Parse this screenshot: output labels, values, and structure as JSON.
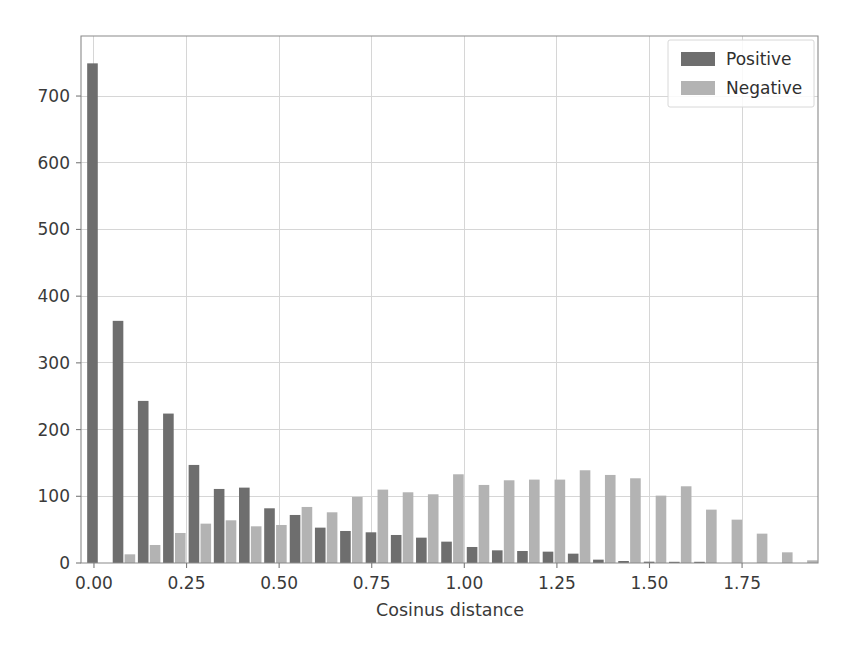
{
  "chart_data": {
    "type": "bar",
    "title": "",
    "subtitle": "",
    "xlabel": "Cosinus distance",
    "ylabel": "",
    "xlim": [
      -0.035,
      1.955
    ],
    "ylim": [
      0,
      790
    ],
    "grid": true,
    "legend_position": "upper right",
    "xticks": [
      0.0,
      0.25,
      0.5,
      0.75,
      1.0,
      1.25,
      1.5,
      1.75
    ],
    "xticklabels": [
      "0.00",
      "0.25",
      "0.50",
      "0.75",
      "1.00",
      "1.25",
      "1.50",
      "1.75"
    ],
    "yticks": [
      0,
      100,
      200,
      300,
      400,
      500,
      600,
      700
    ],
    "yticklabels": [
      "0",
      "100",
      "200",
      "300",
      "400",
      "500",
      "600",
      "700"
    ],
    "bin_width": 0.0682,
    "bin_centers": [
      0.012,
      0.081,
      0.149,
      0.217,
      0.286,
      0.354,
      0.422,
      0.49,
      0.559,
      0.627,
      0.695,
      0.764,
      0.832,
      0.9,
      0.968,
      1.037,
      1.105,
      1.173,
      1.242,
      1.31,
      1.378,
      1.446,
      1.515,
      1.583,
      1.651,
      1.72,
      1.788,
      1.856,
      1.924
    ],
    "series": [
      {
        "name": "Positive",
        "color": "#6e6e6e",
        "values": [
          749,
          363,
          243,
          224,
          147,
          111,
          113,
          82,
          72,
          53,
          48,
          46,
          42,
          38,
          32,
          24,
          19,
          18,
          17,
          14,
          5,
          3,
          2,
          1,
          1,
          0,
          0,
          0,
          0
        ]
      },
      {
        "name": "Negative",
        "color": "#b3b3b3",
        "values": [
          0,
          13,
          27,
          45,
          59,
          64,
          55,
          57,
          84,
          76,
          99,
          110,
          106,
          103,
          133,
          117,
          124,
          125,
          125,
          139,
          132,
          127,
          101,
          115,
          80,
          65,
          44,
          16,
          4
        ]
      }
    ]
  },
  "legend": {
    "entries": [
      {
        "label": "Positive",
        "color": "#6e6e6e"
      },
      {
        "label": "Negative",
        "color": "#b3b3b3"
      }
    ]
  },
  "axes": {
    "xlabel": "Cosinus distance"
  }
}
